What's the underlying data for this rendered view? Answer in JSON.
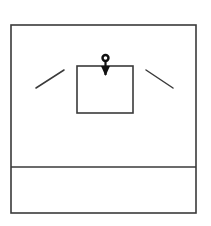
{
  "canvas": {
    "width": 211,
    "height": 226,
    "background_color": "#ffffff",
    "stroke_color": "#3a3a3a",
    "ink_color": "#111111"
  },
  "diagram": {
    "elements": [
      {
        "name": "outer-frame",
        "shape": "rectangle",
        "x": 11,
        "y": 25,
        "width": 185,
        "height": 188,
        "stroke_width": 1.6,
        "fill": "none"
      },
      {
        "name": "bottom-divider",
        "shape": "line",
        "x1": 11,
        "y1": 167,
        "x2": 196,
        "y2": 167,
        "stroke_width": 1.6
      },
      {
        "name": "inner-rectangle",
        "shape": "rectangle",
        "x": 77,
        "y": 66,
        "width": 56,
        "height": 47,
        "stroke_width": 1.6,
        "fill": "none"
      },
      {
        "name": "left-slant-tick",
        "shape": "line",
        "x1": 36,
        "y1": 88,
        "x2": 64,
        "y2": 70,
        "stroke_width": 1.5
      },
      {
        "name": "right-slant-tick",
        "shape": "line",
        "x1": 146,
        "y1": 70,
        "x2": 173,
        "y2": 88,
        "stroke_width": 1.5
      }
    ],
    "load_arrow": {
      "name": "downward-point-load-arrow",
      "direction": "down",
      "ring_center_x": 105.5,
      "ring_center_y": 58,
      "ring_outer_radius": 4.2,
      "ring_stroke_width": 2.4,
      "shaft_x": 105.5,
      "shaft_top_y": 62,
      "shaft_bottom_y": 75,
      "shaft_stroke_width": 2.2,
      "head_tip_x": 105.5,
      "head_tip_y": 76,
      "head_left_x": 101,
      "head_right_x": 110,
      "head_top_y": 66,
      "fill": "#111111"
    }
  }
}
